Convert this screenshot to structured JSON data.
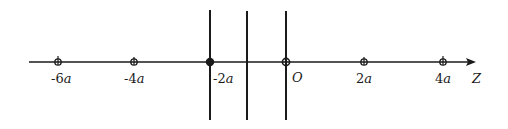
{
  "diagram": {
    "axis": {
      "label": "Z",
      "y": 62,
      "x_start": 29,
      "x_end": 474
    },
    "vertical_lines": [
      {
        "x": 210,
        "y_top": 10,
        "y_bottom": 120
      },
      {
        "x": 247,
        "y_top": 11,
        "y_bottom": 120
      },
      {
        "x": 286,
        "y_top": 11,
        "y_bottom": 120
      }
    ],
    "points": [
      {
        "label_num": "-6",
        "label_var": "a",
        "x": 58
      },
      {
        "label_num": "-4",
        "label_var": "a",
        "x": 134
      },
      {
        "label_num": "-2",
        "label_var": "a",
        "x": 210
      },
      {
        "label_num": "",
        "label_var": "O",
        "x": 286
      },
      {
        "label_num": "2",
        "label_var": "a",
        "x": 364
      },
      {
        "label_num": "4",
        "label_var": "a",
        "x": 443
      }
    ],
    "colors": {
      "stroke": "#1a1a1a",
      "background": "#ffffff"
    }
  }
}
